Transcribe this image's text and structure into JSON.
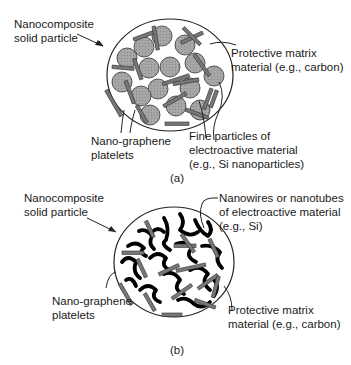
{
  "figure_a": {
    "caption": "(a)",
    "labels": {
      "particle": [
        "Nanocomposite",
        "solid particle"
      ],
      "matrix": [
        "Protective matrix",
        "material (e.g., carbon)"
      ],
      "graphene": [
        "Nano-graphene",
        "platelets"
      ],
      "fine_particles": [
        "Fine particles of",
        "electroactive material",
        "(e.g., Si nanoparticles)"
      ]
    }
  },
  "figure_b": {
    "caption": "(b)",
    "labels": {
      "particle": [
        "Nanocomposite",
        "solid particle"
      ],
      "nanowires": [
        "Nanowires or nanotubes",
        "of electroactive material",
        "(e.g., Si)"
      ],
      "graphene": [
        "Nano-graphene",
        "platelets"
      ],
      "matrix": [
        "Protective matrix",
        "material (e.g., carbon)"
      ]
    }
  },
  "colors": {
    "particle_fill": "#9a9a9a",
    "platelet_fill": "#7a7a7a",
    "wire": "#000000",
    "outline": "#222222"
  }
}
